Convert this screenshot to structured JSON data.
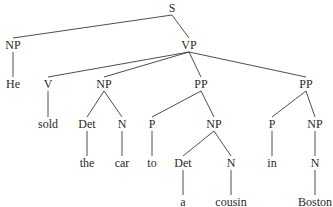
{
  "diagram": {
    "type": "parse-tree",
    "sentence": "He sold the car to a cousin in Boston",
    "nodes": {
      "s": {
        "label": "S",
        "x": 172,
        "y": 8
      },
      "np_subj": {
        "label": "NP",
        "x": 13,
        "y": 45
      },
      "vp": {
        "label": "VP",
        "x": 189,
        "y": 45
      },
      "he": {
        "label": "He",
        "x": 13,
        "y": 84
      },
      "v": {
        "label": "V",
        "x": 48,
        "y": 84
      },
      "np_obj": {
        "label": "NP",
        "x": 104,
        "y": 84
      },
      "pp1": {
        "label": "PP",
        "x": 201,
        "y": 84
      },
      "pp2": {
        "label": "PP",
        "x": 306,
        "y": 84
      },
      "sold": {
        "label": "sold",
        "x": 48,
        "y": 124
      },
      "det1": {
        "label": "Det",
        "x": 87,
        "y": 124
      },
      "n1": {
        "label": "N",
        "x": 122,
        "y": 124
      },
      "p1": {
        "label": "P",
        "x": 152,
        "y": 124
      },
      "np_pp1": {
        "label": "NP",
        "x": 214,
        "y": 124
      },
      "p2": {
        "label": "P",
        "x": 272,
        "y": 124
      },
      "np_pp2": {
        "label": "NP",
        "x": 315,
        "y": 124
      },
      "the": {
        "label": "the",
        "x": 87,
        "y": 163
      },
      "car": {
        "label": "car",
        "x": 122,
        "y": 163
      },
      "to": {
        "label": "to",
        "x": 152,
        "y": 163
      },
      "det2": {
        "label": "Det",
        "x": 183,
        "y": 163
      },
      "n2": {
        "label": "N",
        "x": 231,
        "y": 163
      },
      "in": {
        "label": "in",
        "x": 272,
        "y": 163
      },
      "n3": {
        "label": "N",
        "x": 315,
        "y": 163
      },
      "a": {
        "label": "a",
        "x": 183,
        "y": 202
      },
      "cousin": {
        "label": "cousin",
        "x": 231,
        "y": 202
      },
      "boston": {
        "label": "Boston",
        "x": 315,
        "y": 202
      }
    },
    "edges": [
      [
        "s",
        "np_subj"
      ],
      [
        "s",
        "vp"
      ],
      [
        "np_subj",
        "he"
      ],
      [
        "vp",
        "v"
      ],
      [
        "vp",
        "np_obj"
      ],
      [
        "vp",
        "pp1"
      ],
      [
        "vp",
        "pp2"
      ],
      [
        "v",
        "sold"
      ],
      [
        "np_obj",
        "det1"
      ],
      [
        "np_obj",
        "n1"
      ],
      [
        "det1",
        "the"
      ],
      [
        "n1",
        "car"
      ],
      [
        "pp1",
        "p1"
      ],
      [
        "pp1",
        "np_pp1"
      ],
      [
        "p1",
        "to"
      ],
      [
        "np_pp1",
        "det2"
      ],
      [
        "np_pp1",
        "n2"
      ],
      [
        "det2",
        "a"
      ],
      [
        "n2",
        "cousin"
      ],
      [
        "pp2",
        "p2"
      ],
      [
        "pp2",
        "np_pp2"
      ],
      [
        "p2",
        "in"
      ],
      [
        "np_pp2",
        "n3"
      ],
      [
        "n3",
        "boston"
      ]
    ]
  }
}
